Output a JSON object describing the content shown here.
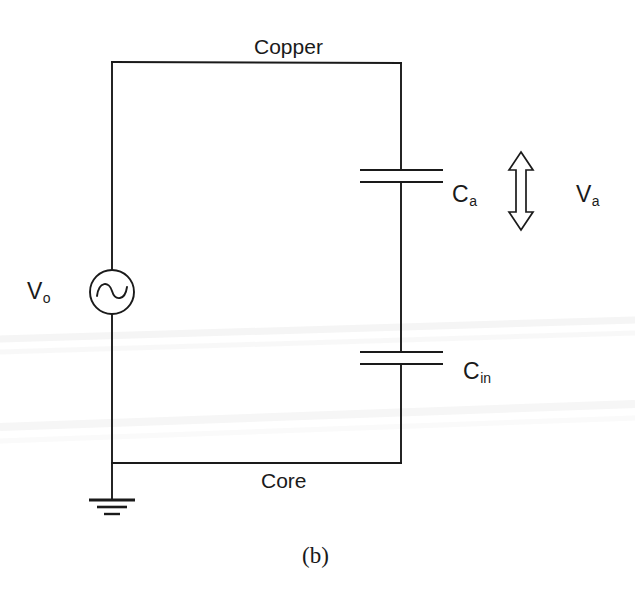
{
  "figure": {
    "caption": "(b)",
    "type": "electrical-circuit-schematic",
    "background_color": "#ffffff",
    "line_color": "#1a1a1a"
  },
  "labels": {
    "top_conductor": "Copper",
    "bottom_conductor": "Core",
    "source": "V",
    "source_sub": "o",
    "cap_upper": "C",
    "cap_upper_sub": "a",
    "cap_lower": "C",
    "cap_lower_sub": "in",
    "arrow_voltage": "V",
    "arrow_voltage_sub": "a"
  },
  "components": [
    {
      "name": "ac-voltage-source",
      "symbol": "circle-with-sine",
      "label": "Vo",
      "position": {
        "cx": 112,
        "cy": 292,
        "r": 22
      }
    },
    {
      "name": "capacitor-ca",
      "symbol": "parallel-plate",
      "label": "Ca",
      "position": {
        "cx": 401,
        "cy": 176,
        "plate_half_width": 41
      }
    },
    {
      "name": "capacitor-cin",
      "symbol": "parallel-plate",
      "label": "Cin",
      "position": {
        "cx": 401,
        "cy": 358,
        "plate_half_width": 41
      }
    },
    {
      "name": "ground",
      "symbol": "earth-ground-three-bar",
      "position": {
        "cx": 112,
        "cy": 500
      }
    },
    {
      "name": "voltage-span-arrow",
      "symbol": "double-headed-vertical-arrow",
      "label": "Va",
      "position": {
        "cx": 521,
        "top": 152,
        "bottom": 230
      }
    }
  ],
  "wires": {
    "left_rail_x": 112,
    "right_rail_x": 401,
    "top_rail_y": 62,
    "bottom_rail_y": 463
  }
}
